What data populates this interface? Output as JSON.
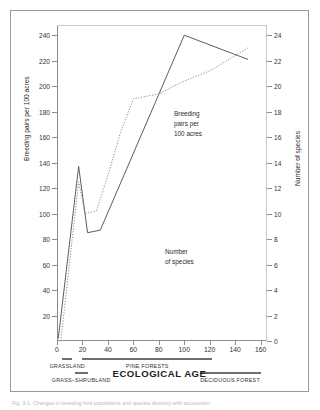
{
  "figure": {
    "xtitle": "ECOLOGICAL AGE",
    "ytitle_left": "Breeding pairs per 100 acres",
    "ytitle_right": "Number of species",
    "annotation_pairs": [
      "Breeding",
      "pairs per",
      "100 acres"
    ],
    "annotation_species": [
      "Number",
      "of species"
    ],
    "caption": "Fig. 3-1. Changes in breeding bird populations and species diversity with succession"
  },
  "axes": {
    "x_ticks": [
      0,
      20,
      40,
      60,
      80,
      100,
      120,
      140,
      160
    ],
    "y_left_ticks": [
      20,
      40,
      60,
      80,
      100,
      120,
      140,
      160,
      180,
      200,
      220,
      240
    ],
    "y_right_ticks": [
      0,
      2,
      4,
      6,
      8,
      10,
      12,
      14,
      16,
      18,
      20,
      22,
      24
    ]
  },
  "habitat_bands": [
    {
      "label": "GRASSLAND",
      "x_start": 4,
      "x_end": 12,
      "row": 0
    },
    {
      "label": "GRASS–SHRUBLAND",
      "x_start": 14,
      "x_end": 24,
      "row": 1
    },
    {
      "label": "PINE FORESTS",
      "x_start": 20,
      "x_end": 122,
      "row": 0
    },
    {
      "label": "DECIDUOUS FOREST",
      "x_start": 112,
      "x_end": 160,
      "row": 1
    }
  ],
  "chart_data": {
    "type": "line",
    "title": "",
    "xlabel": "ECOLOGICAL AGE",
    "ylabel": "Breeding pairs per 100 acres",
    "ylabel_secondary": "Number of species",
    "xlim": [
      0,
      165
    ],
    "ylim": [
      0,
      248
    ],
    "ylim_secondary": [
      0,
      24.8
    ],
    "grid": false,
    "legend": "in-plot annotations",
    "series": [
      {
        "name": "Breeding pairs per 100 acres",
        "axis": "left",
        "style": "solid",
        "color": "#4a4a4a",
        "points": [
          [
            1,
            2
          ],
          [
            17,
            137
          ],
          [
            24,
            85
          ],
          [
            34,
            87
          ],
          [
            100,
            240
          ],
          [
            150,
            221
          ]
        ]
      },
      {
        "name": "Number of species",
        "axis": "right",
        "style": "dotted",
        "color": "#8a8a8a",
        "points": [
          [
            3,
            0
          ],
          [
            17,
            12.5
          ],
          [
            22,
            10
          ],
          [
            31,
            10.2
          ],
          [
            40,
            13
          ],
          [
            50,
            16.4
          ],
          [
            60,
            19
          ],
          [
            80,
            19.4
          ],
          [
            100,
            20.4
          ],
          [
            120,
            21.2
          ],
          [
            150,
            23
          ]
        ]
      }
    ]
  }
}
